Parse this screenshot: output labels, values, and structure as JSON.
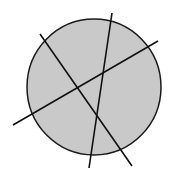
{
  "diagram": {
    "canvas": {
      "width": 171,
      "height": 177,
      "background": "#ffffff"
    },
    "circle": {
      "cx": 94,
      "cy": 87,
      "rx": 67,
      "ry": 68,
      "fill": "#c9c9c9",
      "stroke": "#1a1a1a",
      "stroke_width": 1.5
    },
    "lines": [
      {
        "id": "line-a",
        "x1": 40,
        "y1": 34,
        "x2": 132,
        "y2": 166,
        "stroke": "#111111",
        "stroke_width": 1.6
      },
      {
        "id": "line-b",
        "x1": 112,
        "y1": 13,
        "x2": 89,
        "y2": 168,
        "stroke": "#111111",
        "stroke_width": 1.6
      },
      {
        "id": "line-c",
        "x1": 13,
        "y1": 125,
        "x2": 158,
        "y2": 41,
        "stroke": "#111111",
        "stroke_width": 1.6
      }
    ]
  }
}
